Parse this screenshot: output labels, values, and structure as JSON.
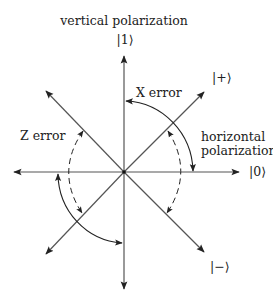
{
  "labels": {
    "vertical_title": "vertical polarization",
    "ket_one": "|1⟩",
    "ket_plus": "|+⟩",
    "x_error": "X error",
    "z_error": "Z error",
    "horizontal_line1": "horizontal",
    "horizontal_line2": "polarization",
    "ket_zero": "|0⟩",
    "ket_minus": "|−⟩"
  },
  "colors": {
    "axis": "#555555",
    "arc": "#222222",
    "text": "#222222"
  }
}
